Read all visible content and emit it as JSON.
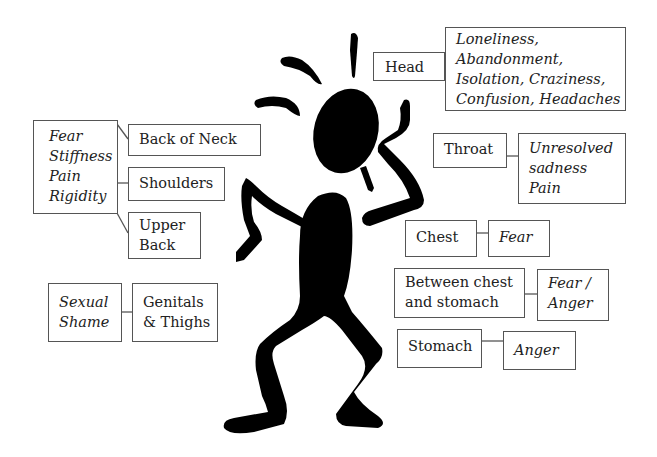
{
  "diagram": {
    "figure": "stressed stick figure silhouette",
    "right_side": [
      {
        "region": "Head",
        "emotions": [
          "Loneliness,",
          "Abandonment,",
          "Isolation, Craziness,",
          "Confusion, Headaches"
        ]
      },
      {
        "region": "Throat",
        "emotions": [
          "Unresolved",
          "sadness",
          "Pain"
        ]
      },
      {
        "region": "Chest",
        "emotions": [
          "Fear"
        ]
      },
      {
        "region_lines": [
          "Between chest",
          "and stomach"
        ],
        "emotions": [
          "Fear /",
          "Anger"
        ]
      },
      {
        "region": "Stomach",
        "emotions": [
          "Anger"
        ]
      }
    ],
    "left_side": {
      "shared_emotions": [
        "Fear",
        "Stiffness",
        "Pain",
        "Rigidity"
      ],
      "regions": [
        {
          "region": "Back of Neck"
        },
        {
          "region": "Shoulders"
        },
        {
          "region_lines": [
            "Upper",
            "Back"
          ]
        }
      ],
      "sexual": {
        "emotions": [
          "Sexual",
          "Shame"
        ],
        "region_lines": [
          "Genitals",
          "& Thighs"
        ]
      }
    }
  }
}
